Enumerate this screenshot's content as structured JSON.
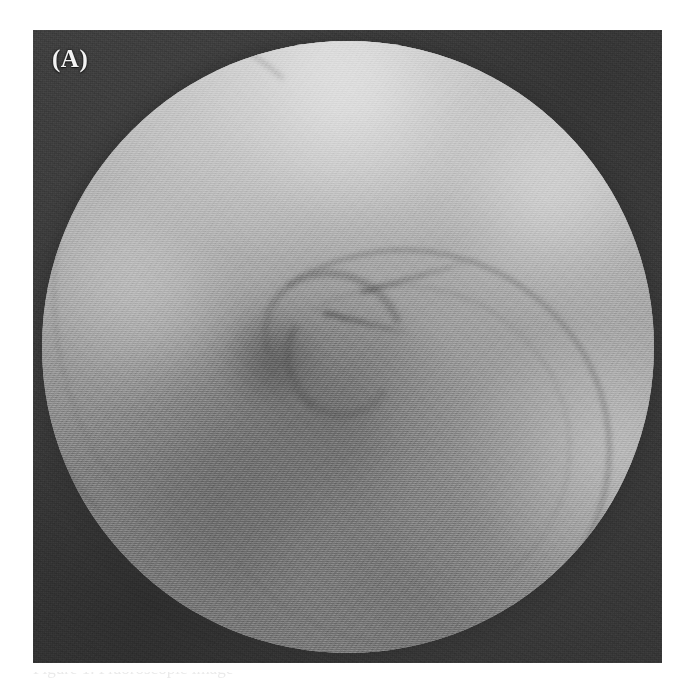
{
  "figure": {
    "panel_label": "(A)",
    "modality_name": "fluoroscopic-radiograph",
    "alt_description": "Fluoroscopic contrast radiograph with circular collimated field of view showing curvilinear contrast-filled visceral structures and a central angulated segment",
    "field_of_view_shape": "circle",
    "colors": {
      "surround": "#3b3b3b",
      "field_mid_gray": "#8f8f8f",
      "field_bright": "#c8c8c8",
      "field_dark": "#6e6e6e",
      "label_text": "#f2f2f2",
      "page_background": "#ffffff"
    }
  },
  "caption": {
    "prefix": "Figure",
    "number": "1",
    "clipped_text": "Figure 1. Fluoroscopic image",
    "visible": "partially-clipped"
  },
  "features": [
    {
      "name": "left-lateral-arc",
      "label": "Curvilinear contrast-filled structure, left lateral"
    },
    {
      "name": "right-major-arc",
      "label": "Large curvilinear contrast-filled arc, right"
    },
    {
      "name": "central-hook",
      "label": "Central angulated segment"
    },
    {
      "name": "dense-focus",
      "label": "Dense focus left of midline"
    },
    {
      "name": "bright-superior-zone",
      "label": "Increased radiolucency, superior field"
    }
  ]
}
